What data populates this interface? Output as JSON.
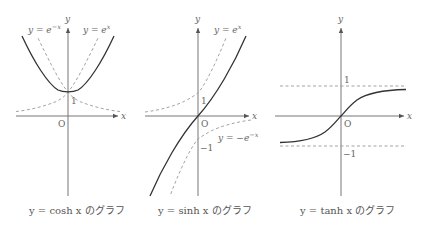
{
  "panels": [
    {
      "id": "cosh",
      "caption": "y = cosh x のグラフ",
      "axis_labels": {
        "x": "x",
        "y": "y",
        "origin": "O"
      },
      "ticks": {
        "one": "1"
      },
      "annotations": [
        "y = e^{-x}",
        "y = e^{x}"
      ],
      "ann_text": {
        "left": "y = e",
        "left_sup": "−x",
        "right": "y = e",
        "right_sup": "x"
      }
    },
    {
      "id": "sinh",
      "caption": "y = sinh x のグラフ",
      "axis_labels": {
        "x": "x",
        "y": "y",
        "origin": "O"
      },
      "ticks": {
        "one": "1",
        "minus_one": "−1"
      },
      "annotations": [
        "y = e^{x}",
        "y = −e^{-x}"
      ],
      "ann_text": {
        "top": "y = e",
        "top_sup": "x",
        "bottom": "y = −e",
        "bottom_sup": "−x"
      }
    },
    {
      "id": "tanh",
      "caption": "y = tanh x のグラフ",
      "axis_labels": {
        "x": "x",
        "y": "y",
        "origin": "O"
      },
      "ticks": {
        "one": "1",
        "minus_one": "−1"
      },
      "asymptotes": [
        1,
        -1
      ]
    }
  ],
  "colors": {
    "curve": "#333333",
    "axis": "#777777",
    "dashed": "#999999",
    "text": "#666666"
  }
}
